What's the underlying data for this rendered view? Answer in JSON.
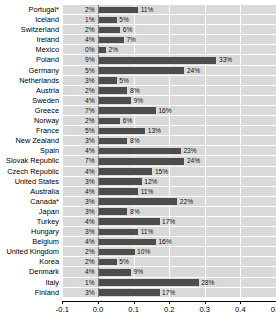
{
  "chart_data": {
    "type": "bar",
    "orientation": "horizontal",
    "title": "",
    "xlabel": "",
    "ylabel": "",
    "xlim": [
      -0.13,
      0.5
    ],
    "xticks": [
      "-0.1",
      "0.0",
      "0.1",
      "0.2",
      "0.3",
      "0.4",
      "0.5"
    ],
    "xtick_values": [
      -0.1,
      0.0,
      0.1,
      0.2,
      0.3,
      0.4,
      0.5
    ],
    "grid": "vertical-white",
    "legend": "none",
    "categories": [
      "Portugal*",
      "Iceland",
      "Switzerland",
      "Ireland",
      "Mexico",
      "Poland",
      "Germany",
      "Netherlands",
      "Austria",
      "Sweden",
      "Greece",
      "Norway",
      "France",
      "New Zealand",
      "Spain",
      "Slovak Republic",
      "Czech Republic",
      "United States",
      "Australia",
      "Canada*",
      "Japan",
      "Turkey",
      "Hungary",
      "Belgium",
      "United Kingdom",
      "Korea",
      "Denmark",
      "Italy",
      "Finland"
    ],
    "left_value_labels": [
      "2%",
      "1%",
      "2%",
      "4%",
      "0%",
      "9%",
      "5%",
      "3%",
      "2%",
      "4%",
      "7%",
      "2%",
      "5%",
      "3%",
      "4%",
      "7%",
      "4%",
      "3%",
      "4%",
      "3%",
      "3%",
      "4%",
      "3%",
      "4%",
      "2%",
      "2%",
      "4%",
      "1%",
      "3%"
    ],
    "bar_value_labels": [
      "11%",
      "5%",
      "6%",
      "7%",
      "2%",
      "33%",
      "24%",
      "5%",
      "8%",
      "9%",
      "16%",
      "6%",
      "13%",
      "8%",
      "23%",
      "24%",
      "15%",
      "12%",
      "11%",
      "22%",
      "8%",
      "17%",
      "11%",
      "16%",
      "10%",
      "5%",
      "9%",
      "28%",
      "17%"
    ],
    "values": [
      0.11,
      0.05,
      0.06,
      0.07,
      0.02,
      0.33,
      0.24,
      0.05,
      0.08,
      0.09,
      0.16,
      0.06,
      0.13,
      0.08,
      0.23,
      0.24,
      0.15,
      0.12,
      0.11,
      0.22,
      0.08,
      0.17,
      0.11,
      0.16,
      0.1,
      0.05,
      0.09,
      0.28,
      0.17
    ],
    "series": [
      {
        "name": "value",
        "values": [
          0.11,
          0.05,
          0.06,
          0.07,
          0.02,
          0.33,
          0.24,
          0.05,
          0.08,
          0.09,
          0.16,
          0.06,
          0.13,
          0.08,
          0.23,
          0.24,
          0.15,
          0.12,
          0.11,
          0.22,
          0.08,
          0.17,
          0.11,
          0.16,
          0.1,
          0.05,
          0.09,
          0.28,
          0.17
        ]
      }
    ],
    "colors": {
      "bar": "#4d4d4d",
      "plot_band": "#d9d9d9",
      "gridline": "#ffffff",
      "axis": "#000000"
    }
  },
  "rows": [
    {
      "label": "Portugal*",
      "left": "2%",
      "bar": "11%",
      "value": 0.11,
      "left_pos": "axis"
    },
    {
      "label": "Iceland",
      "left": "1%",
      "bar": "5%",
      "value": 0.05,
      "left_pos": "axis"
    },
    {
      "label": "Switzerland",
      "left": "2%",
      "bar": "6%",
      "value": 0.06,
      "left_pos": "axis"
    },
    {
      "label": "Ireland",
      "left": "4%",
      "bar": "7%",
      "value": 0.07,
      "left_pos": "axis"
    },
    {
      "label": "Mexico",
      "left": "0%",
      "bar": "2%",
      "value": 0.02,
      "left_pos": "axis"
    },
    {
      "label": "Poland",
      "left": "9%",
      "bar": "33%",
      "value": 0.33,
      "left_pos": "axis"
    },
    {
      "label": "Germany",
      "left": "5%",
      "bar": "24%",
      "value": 0.24,
      "left_pos": "axis"
    },
    {
      "label": "Netherlands",
      "left": "3%",
      "bar": "5%",
      "value": 0.05,
      "left_pos": "axis"
    },
    {
      "label": "Austria",
      "left": "2%",
      "bar": "8%",
      "value": 0.08,
      "left_pos": "axis"
    },
    {
      "label": "Sweden",
      "left": "4%",
      "bar": "9%",
      "value": 0.09,
      "left_pos": "axis"
    },
    {
      "label": "Greece",
      "left": "7%",
      "bar": "16%",
      "value": 0.16,
      "left_pos": "axis"
    },
    {
      "label": "Norway",
      "left": "2%",
      "bar": "6%",
      "value": 0.06,
      "left_pos": "axis"
    },
    {
      "label": "France",
      "left": "5%",
      "bar": "13%",
      "value": 0.13,
      "left_pos": "axis"
    },
    {
      "label": "New Zealand",
      "left": "3%",
      "bar": "8%",
      "value": 0.08,
      "left_pos": "axis"
    },
    {
      "label": "Spain",
      "left": "4%",
      "bar": "23%",
      "value": 0.23,
      "left_pos": "axis"
    },
    {
      "label": "Slovak Republic",
      "left": "7%",
      "bar": "24%",
      "value": 0.24,
      "left_pos": "axis"
    },
    {
      "label": "Czech Republic",
      "left": "4%",
      "bar": "15%",
      "value": 0.15,
      "left_pos": "axis"
    },
    {
      "label": "United States",
      "left": "3%",
      "bar": "12%",
      "value": 0.12,
      "left_pos": "axis"
    },
    {
      "label": "Australia",
      "left": "4%",
      "bar": "11%",
      "value": 0.11,
      "left_pos": "axis"
    },
    {
      "label": "Canada*",
      "left": "3%",
      "bar": "22%",
      "value": 0.22,
      "left_pos": "axis"
    },
    {
      "label": "Japan",
      "left": "3%",
      "bar": "8%",
      "value": 0.08,
      "left_pos": "axis"
    },
    {
      "label": "Turkey",
      "left": "4%",
      "bar": "17%",
      "value": 0.17,
      "left_pos": "axis"
    },
    {
      "label": "Hungary",
      "left": "3%",
      "bar": "11%",
      "value": 0.11,
      "left_pos": "axis"
    },
    {
      "label": "Belgium",
      "left": "4%",
      "bar": "16%",
      "value": 0.16,
      "left_pos": "axis"
    },
    {
      "label": "United Kingdom",
      "left": "2%",
      "bar": "10%",
      "value": 0.1,
      "left_pos": "axis"
    },
    {
      "label": "Korea",
      "left": "2%",
      "bar": "5%",
      "value": 0.05,
      "left_pos": "axis"
    },
    {
      "label": "Denmark",
      "left": "4%",
      "bar": "9%",
      "value": 0.09,
      "left_pos": "axis"
    },
    {
      "label": "Italy",
      "left": "1%",
      "bar": "28%",
      "value": 0.28,
      "left_pos": "axis"
    },
    {
      "label": "Finland",
      "left": "3%",
      "bar": "17%",
      "value": 0.17,
      "left_pos": "axis"
    }
  ],
  "axis": {
    "ticks": [
      "-0.1",
      "0.0",
      "0.1",
      "0.2",
      "0.3",
      "0.4",
      "0.5"
    ]
  }
}
